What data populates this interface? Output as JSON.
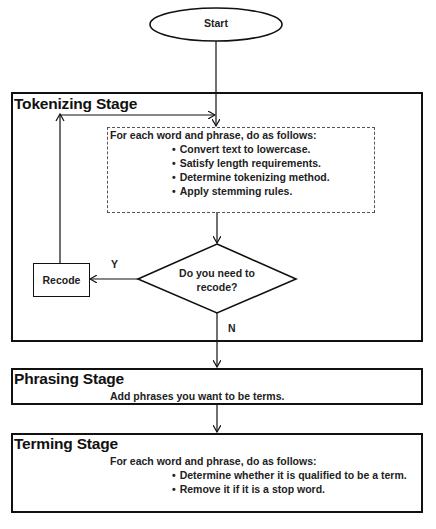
{
  "diagram": {
    "start": {
      "label": "Start"
    },
    "tokenizing_stage": {
      "title": "Tokenizing Stage",
      "intro": "For each word and phrase, do as follows:",
      "steps": [
        "Convert text to lowercase.",
        "Satisfy length requirements.",
        "Determine tokenizing method.",
        "Apply stemming rules."
      ],
      "decision": {
        "line1": "Do you need to",
        "line2": "recode?"
      },
      "recode": {
        "label": "Recode"
      },
      "yes_label": "Y",
      "no_label": "N"
    },
    "phrasing_stage": {
      "title": "Phrasing Stage",
      "text": "Add phrases you want to be terms."
    },
    "terming_stage": {
      "title": "Terming Stage",
      "intro": "For each word and phrase, do as follows:",
      "steps": [
        "Determine whether it is qualified to be a term.",
        "Remove it if it is a stop word."
      ]
    }
  },
  "colors": {
    "stroke": "#111111",
    "background": "#ffffff",
    "dashed": "#555555"
  }
}
